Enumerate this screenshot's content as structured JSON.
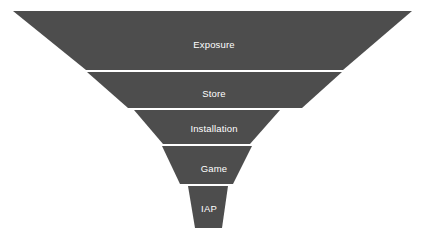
{
  "chart_data": {
    "type": "funnel",
    "title": "",
    "subtitle": "",
    "xlabel": "",
    "ylabel": "",
    "grid": false,
    "legend": "none",
    "background_color": "#ffffff",
    "segment_color": "#4d4d4d",
    "label_color": "#ffffff",
    "categories": [
      "Exposure",
      "Store",
      "Installation",
      "Game",
      "IAP"
    ],
    "values": [
      399,
      255,
      146,
      90,
      40
    ],
    "value_unit": "relative width (px)",
    "stages": [
      {
        "label": "Exposure",
        "order": 1,
        "top_width": 399,
        "bottom_width": 257,
        "top_y": 11,
        "bottom_y": 70,
        "top_left_x": 13,
        "top_right_x": 412,
        "bottom_left_x": 86,
        "bottom_right_x": 343,
        "label_x": 214,
        "label_y": 45
      },
      {
        "label": "Store",
        "order": 2,
        "top_width": 255,
        "bottom_width": 174,
        "top_y": 72,
        "bottom_y": 108,
        "top_left_x": 87,
        "top_right_x": 342,
        "bottom_left_x": 128,
        "bottom_right_x": 302,
        "label_x": 214,
        "label_y": 94
      },
      {
        "label": "Installation",
        "order": 3,
        "top_width": 146,
        "bottom_width": 87,
        "top_y": 110,
        "bottom_y": 144,
        "top_left_x": 134,
        "top_right_x": 280,
        "bottom_left_x": 163,
        "bottom_right_x": 250,
        "label_x": 214,
        "label_y": 129
      },
      {
        "label": "Game",
        "order": 4,
        "top_width": 90,
        "bottom_width": 53,
        "top_y": 146,
        "bottom_y": 184,
        "top_left_x": 162,
        "top_right_x": 252,
        "bottom_left_x": 180,
        "bottom_right_x": 233,
        "label_x": 214,
        "label_y": 169
      },
      {
        "label": "IAP",
        "order": 5,
        "top_width": 40,
        "bottom_width": 27,
        "top_y": 186,
        "bottom_y": 228,
        "top_left_x": 188,
        "top_right_x": 228,
        "bottom_left_x": 195,
        "bottom_right_x": 222,
        "label_x": 209,
        "label_y": 209
      }
    ]
  }
}
